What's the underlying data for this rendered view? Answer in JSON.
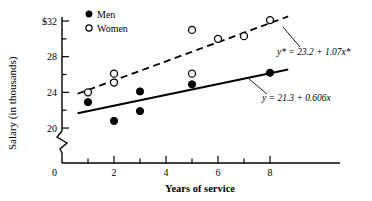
{
  "chart_data": {
    "type": "scatter",
    "title": "",
    "xlabel": "Years of service",
    "ylabel": "Salary (in thousands)",
    "xlim": [
      0,
      9
    ],
    "ylim": [
      19,
      33
    ],
    "grid": false,
    "axis_break": true,
    "legend_position": "top-left",
    "xticks": [
      "0",
      "2",
      "4",
      "6",
      "8"
    ],
    "xtick_values": [
      0,
      2,
      4,
      6,
      8
    ],
    "xminor_values": [
      1,
      3,
      5,
      7
    ],
    "yticks": [
      "$32",
      "28",
      "24",
      "20",
      "0"
    ],
    "ytick_values": [
      32,
      28,
      24,
      20
    ],
    "yminor_values": [
      30,
      26,
      22
    ],
    "series": [
      {
        "name": "Men",
        "marker": "filled-circle",
        "points": [
          {
            "x": 1,
            "y": 22.9
          },
          {
            "x": 2,
            "y": 20.8
          },
          {
            "x": 3,
            "y": 24.1
          },
          {
            "x": 3,
            "y": 21.9
          },
          {
            "x": 5,
            "y": 24.9
          },
          {
            "x": 8,
            "y": 26.2
          }
        ]
      },
      {
        "name": "Women",
        "marker": "open-circle",
        "points": [
          {
            "x": 1,
            "y": 24.0
          },
          {
            "x": 2,
            "y": 26.1
          },
          {
            "x": 2,
            "y": 25.1
          },
          {
            "x": 5,
            "y": 31.0
          },
          {
            "x": 5,
            "y": 26.1
          },
          {
            "x": 6,
            "y": 30.0
          },
          {
            "x": 7,
            "y": 30.3
          },
          {
            "x": 8,
            "y": 32.1
          }
        ]
      }
    ],
    "fits": [
      {
        "name": "Women regression",
        "label": "y* = 23.2 + 1.07x*",
        "intercept": 23.2,
        "slope": 1.07,
        "style": "dashed"
      },
      {
        "name": "Men regression",
        "label": "y = 21.3 + 0.606x",
        "intercept": 21.3,
        "slope": 0.606,
        "style": "solid"
      }
    ],
    "annotations": [
      {
        "text": "y* = 23.2 + 1.07x*",
        "anchor_x": 8.0,
        "anchor_y": 32.0
      },
      {
        "text": "y = 21.3 + 0.606x",
        "anchor_x": 7.0,
        "anchor_y": 25.6
      }
    ]
  },
  "legend": {
    "items": [
      {
        "label": "Men",
        "marker": "filled-circle"
      },
      {
        "label": "Women",
        "marker": "open-circle"
      }
    ]
  },
  "axes": {
    "x_title": "Years of service",
    "y_title": "Salary (in thousands)",
    "x_labels": [
      "0",
      "2",
      "4",
      "6",
      "8"
    ],
    "y_labels": [
      "$32",
      "28",
      "24",
      "20",
      "0"
    ]
  },
  "equations": {
    "women": "y* = 23.2 + 1.07x*",
    "men": "y = 21.3 + 0.606x"
  },
  "colors": {
    "ink": "#000000",
    "background": "#ffffff"
  }
}
